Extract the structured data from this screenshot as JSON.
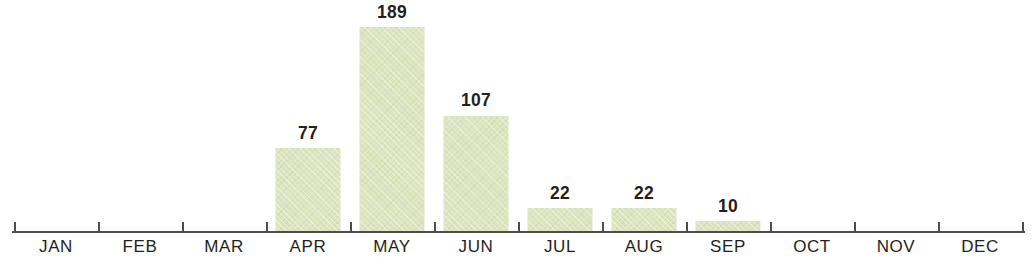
{
  "chart_data": {
    "type": "bar",
    "title": "",
    "subtitle": "",
    "xlabel": "",
    "ylabel": "",
    "categories": [
      "JAN",
      "FEB",
      "MAR",
      "APR",
      "MAY",
      "JUN",
      "JUL",
      "AUG",
      "SEP",
      "OCT",
      "NOV",
      "DEC"
    ],
    "values": [
      0,
      0,
      0,
      77,
      189,
      107,
      22,
      22,
      10,
      0,
      0,
      0
    ],
    "data_labels": [
      "",
      "",
      "",
      "77",
      "189",
      "107",
      "22",
      "22",
      "10",
      "",
      "",
      ""
    ],
    "ylim": [
      0,
      189
    ],
    "grid": false,
    "legend": false,
    "legend_position": "none",
    "axis": {
      "x_axis_visible": true,
      "y_axis_visible": false,
      "ticks_visible": true,
      "tick_count": 12
    },
    "colors": {
      "bar_fill": "#dde5c0",
      "axis": "#4d4d4d",
      "text": "#231f20",
      "background": "#ffffff"
    }
  }
}
